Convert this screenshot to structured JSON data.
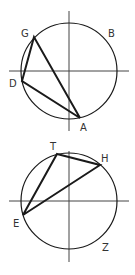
{
  "diagrams": [
    {
      "name": "figure-1",
      "circle": {
        "cx": 69,
        "cy": 71,
        "r": 48
      },
      "axes": {
        "h": {
          "x1": 9,
          "x2": 129,
          "y": 71
        },
        "v": {
          "x": 69,
          "y1": 11,
          "y2": 131
        }
      },
      "points": {
        "G": {
          "x": 34,
          "y": 37,
          "label": "G",
          "lx": 21,
          "ly": 37
        },
        "D": {
          "x": 22,
          "y": 81,
          "label": "D",
          "lx": 9,
          "ly": 87
        },
        "A": {
          "x": 80,
          "y": 118,
          "label": "A",
          "lx": 80,
          "ly": 131
        },
        "B": {
          "label": "B",
          "lx": 108,
          "ly": 37
        }
      },
      "triangle": [
        "G",
        "D",
        "A"
      ]
    },
    {
      "name": "figure-2",
      "circle": {
        "cx": 69,
        "cy": 201,
        "r": 48
      },
      "axes": {
        "h": {
          "x1": 9,
          "x2": 129,
          "y": 201
        },
        "v": {
          "x": 69,
          "y1": 151,
          "y2": 262
        }
      },
      "points": {
        "T": {
          "x": 57,
          "y": 154,
          "label": "T",
          "lx": 50,
          "ly": 150
        },
        "H": {
          "x": 100,
          "y": 165,
          "label": "H",
          "lx": 101,
          "ly": 162
        },
        "E": {
          "x": 23,
          "y": 215,
          "label": "E",
          "lx": 13,
          "ly": 227
        },
        "Z": {
          "label": "Z",
          "lx": 102,
          "ly": 251
        }
      },
      "triangle": [
        "T",
        "H",
        "E"
      ]
    }
  ],
  "colors": {
    "stroke": "#1a1a1a",
    "label": "#333333",
    "background": "#ffffff"
  }
}
